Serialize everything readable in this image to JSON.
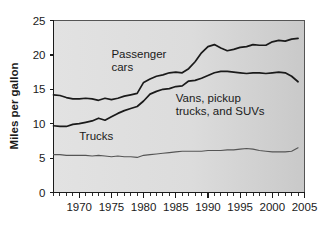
{
  "chart_data": {
    "type": "line",
    "title": "",
    "subtitle": "",
    "xlabel": "",
    "ylabel": "Miles per gallon",
    "xlim": [
      1966,
      2005
    ],
    "ylim": [
      0,
      25
    ],
    "grid": false,
    "legend_position": "inline-annotations",
    "x_ticks": [
      1970,
      1975,
      1980,
      1985,
      1990,
      1995,
      2000,
      2005
    ],
    "x_tick_labels": [
      "1970",
      "1975",
      "1980",
      "1985",
      "1990",
      "1995",
      "2000",
      "2005"
    ],
    "x_minor_tick_interval": 1,
    "y_ticks": [
      0,
      5,
      10,
      15,
      20,
      25
    ],
    "y_tick_labels": [
      "0",
      "5",
      "10",
      "15",
      "20",
      "25"
    ],
    "x": [
      1966,
      1967,
      1968,
      1969,
      1970,
      1971,
      1972,
      1973,
      1974,
      1975,
      1976,
      1977,
      1978,
      1979,
      1980,
      1981,
      1982,
      1983,
      1984,
      1985,
      1986,
      1987,
      1988,
      1989,
      1990,
      1991,
      1992,
      1993,
      1994,
      1995,
      1996,
      1997,
      1998,
      1999,
      2000,
      2001,
      2002,
      2003,
      2004
    ],
    "series": [
      {
        "name": "Passenger cars",
        "color": "#1a1a1a",
        "label_text": "Passenger\ncars",
        "values": [
          14.2,
          14.1,
          13.8,
          13.6,
          13.6,
          13.7,
          13.6,
          13.4,
          13.7,
          13.5,
          13.7,
          14.0,
          14.2,
          14.4,
          16.0,
          16.5,
          16.9,
          17.1,
          17.4,
          17.5,
          17.4,
          18.0,
          19.0,
          20.3,
          21.2,
          21.5,
          21.0,
          20.6,
          20.8,
          21.1,
          21.2,
          21.5,
          21.4,
          21.4,
          21.9,
          22.1,
          22.0,
          22.3,
          22.4
        ]
      },
      {
        "name": "Vans, pickup trucks, and SUVs",
        "color": "#1a1a1a",
        "label_text": "Vans, pickup\ntrucks, and SUVs",
        "values": [
          9.7,
          9.6,
          9.6,
          9.9,
          10.0,
          10.2,
          10.4,
          10.8,
          10.5,
          11.0,
          11.5,
          11.9,
          12.2,
          12.5,
          13.3,
          14.3,
          14.7,
          15.0,
          15.1,
          15.4,
          15.5,
          16.2,
          16.3,
          16.6,
          17.0,
          17.4,
          17.6,
          17.6,
          17.5,
          17.4,
          17.3,
          17.4,
          17.4,
          17.3,
          17.4,
          17.5,
          17.4,
          16.9,
          16.1
        ]
      },
      {
        "name": "Trucks",
        "color": "#555555",
        "label_text": "Trucks",
        "values": [
          5.5,
          5.5,
          5.4,
          5.4,
          5.4,
          5.4,
          5.3,
          5.4,
          5.3,
          5.2,
          5.3,
          5.2,
          5.2,
          5.1,
          5.4,
          5.5,
          5.6,
          5.7,
          5.8,
          5.9,
          6.0,
          6.0,
          6.0,
          6.0,
          6.1,
          6.1,
          6.1,
          6.2,
          6.2,
          6.3,
          6.4,
          6.3,
          6.1,
          6.0,
          5.9,
          5.9,
          5.9,
          6.0,
          6.5
        ]
      }
    ],
    "annotations": [
      {
        "text_line1": "Passenger",
        "text_line2": "cars",
        "x": 1975.0,
        "y": 19.5
      },
      {
        "text_line1": "Vans, pickup",
        "text_line2": "trucks, and SUVs",
        "x": 1985.0,
        "y": 13.2
      },
      {
        "text_line1": "Trucks",
        "text_line2": "",
        "x": 1970.0,
        "y": 7.6
      }
    ]
  }
}
